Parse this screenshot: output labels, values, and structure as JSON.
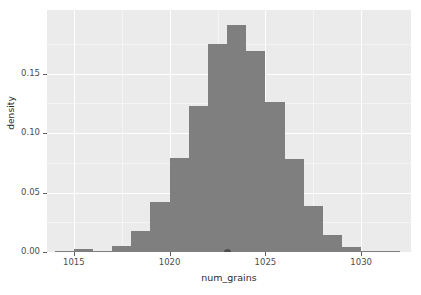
{
  "chart_data": {
    "type": "bar",
    "title": "",
    "subtitle": "",
    "xlabel": "num_grains",
    "ylabel": "density",
    "xlim": [
      1013.6,
      1032.6
    ],
    "ylim": [
      0.0,
      0.2035
    ],
    "grid": true,
    "legend": null,
    "binwidth": 1,
    "bar_color": "#7f7f7f",
    "panel_color": "#ebebeb",
    "grid_color": "#ffffff",
    "x_ticks": [
      1015,
      1020,
      1025,
      1030
    ],
    "x_tick_labels": [
      "1015",
      "1020",
      "1025",
      "1030"
    ],
    "x_minor_ticks": [
      1017.5,
      1022.5,
      1027.5
    ],
    "y_ticks": [
      0.0,
      0.05,
      0.1,
      0.15
    ],
    "y_tick_labels": [
      "0.00",
      "0.05",
      "0.10",
      "0.15"
    ],
    "y_minor_ticks": [
      0.025,
      0.075,
      0.125,
      0.175
    ],
    "categories": [
      1014.5,
      1015.5,
      1016.5,
      1017.5,
      1018.5,
      1019.5,
      1020.5,
      1021.5,
      1022.5,
      1023.5,
      1024.5,
      1025.5,
      1026.5,
      1027.5,
      1028.5,
      1029.5,
      1030.5,
      1031.5
    ],
    "values": [
      0.0005,
      0.0025,
      0.0005,
      0.005,
      0.018,
      0.042,
      0.079,
      0.123,
      0.175,
      0.191,
      0.169,
      0.126,
      0.078,
      0.039,
      0.014,
      0.004,
      0.0005,
      0.0005
    ],
    "annotations": [
      {
        "name": "rug-point",
        "x": 1023.0,
        "y": 0.0,
        "shape": "circle",
        "color": "#4d4d4d"
      }
    ]
  },
  "axes": {
    "y_title": "density",
    "x_title": "num_grains"
  }
}
